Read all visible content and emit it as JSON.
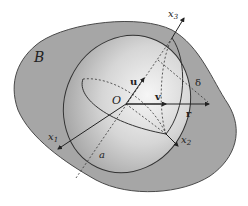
{
  "diagram": {
    "region_label": "B",
    "origin_label": "O",
    "axes": [
      {
        "id": "x1",
        "label": "x",
        "subscript": "1"
      },
      {
        "id": "x2",
        "label": "x",
        "subscript": "2"
      },
      {
        "id": "x3",
        "label": "x",
        "subscript": "3"
      }
    ],
    "vectors": [
      {
        "id": "u",
        "label": "u"
      },
      {
        "id": "v",
        "label": "v"
      },
      {
        "id": "r",
        "label": "r"
      }
    ],
    "distance_label": "δ",
    "semi_axis_label": "a",
    "colors": {
      "region_fill": "#a6a6a6",
      "region_stroke": "#4a4a4a",
      "ellipsoid_light": "#f4f4f4",
      "ellipsoid_dark": "#b0b0b0",
      "line": "#222222",
      "background": "#ffffff"
    }
  }
}
